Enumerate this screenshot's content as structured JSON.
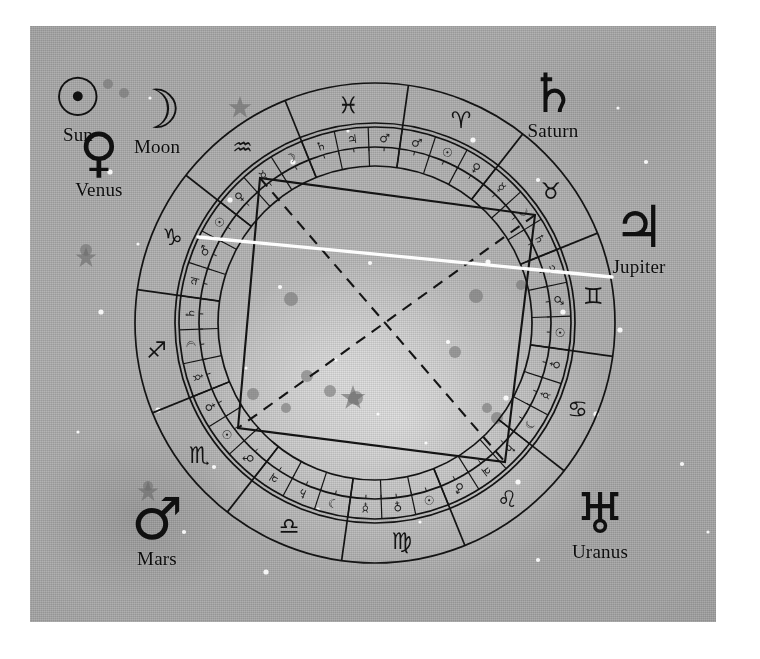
{
  "image": {
    "title": "Astrological natal chart wheel over a starfield photograph",
    "background_color": "#a9a9a9",
    "ink_color": "#141414",
    "highlight_line_color": "#ffffff",
    "plate": {
      "x": 30,
      "y": 26,
      "width": 686,
      "height": 596
    }
  },
  "planet_labels": [
    {
      "name": "Sun",
      "glyph": "☉",
      "icon": "sun-symbol",
      "x": 78,
      "y": 72,
      "glyph_size": 54,
      "label_x": 79,
      "label_y": 112
    },
    {
      "name": "Moon",
      "glyph": "☽",
      "icon": "moon-symbol",
      "x": 157,
      "y": 84,
      "glyph_size": 54,
      "label_x": 152,
      "label_y": 138
    },
    {
      "name": "Venus",
      "glyph": "♀",
      "icon": "venus-symbol",
      "x": 99,
      "y": 127,
      "glyph_size": 54,
      "label_x": 99,
      "label_y": 188
    },
    {
      "name": "Saturn",
      "glyph": "♄",
      "icon": "saturn-symbol",
      "x": 553,
      "y": 68,
      "glyph_size": 54,
      "label_x": 551,
      "label_y": 126
    },
    {
      "name": "Jupiter",
      "glyph": "♃",
      "icon": "jupiter-symbol",
      "x": 639,
      "y": 200,
      "glyph_size": 58,
      "label_x": 636,
      "label_y": 252
    },
    {
      "name": "Mars",
      "glyph": "♂",
      "icon": "mars-symbol",
      "x": 157,
      "y": 492,
      "glyph_size": 58,
      "label_x": 158,
      "label_y": 548
    },
    {
      "name": "Uranus",
      "glyph": "♅",
      "icon": "uranus-symbol",
      "x": 600,
      "y": 487,
      "glyph_size": 56,
      "label_x": 597,
      "label_y": 539
    }
  ],
  "wheel": {
    "center_x": 375,
    "center_y": 323,
    "radius_outer": 240,
    "radius_sign_band_inner": 200,
    "radius_decan_outer": 196,
    "radius_decan_mid": 176,
    "radius_decan_inner": 157,
    "rotation_deg": 8,
    "signs": [
      {
        "name": "Aries",
        "glyph": "♈",
        "index": 0
      },
      {
        "name": "Taurus",
        "glyph": "♉",
        "index": 1
      },
      {
        "name": "Gemini",
        "glyph": "♊",
        "index": 2
      },
      {
        "name": "Cancer",
        "glyph": "♋",
        "index": 3
      },
      {
        "name": "Leo",
        "glyph": "♌",
        "index": 4
      },
      {
        "name": "Virgo",
        "glyph": "♍",
        "index": 5
      },
      {
        "name": "Libra",
        "glyph": "♎",
        "index": 6
      },
      {
        "name": "Scorpio",
        "glyph": "♏",
        "index": 7
      },
      {
        "name": "Sagittarius",
        "glyph": "♐",
        "index": 8
      },
      {
        "name": "Capricorn",
        "glyph": "♑",
        "index": 9
      },
      {
        "name": "Aquarius",
        "glyph": "♒",
        "index": 10
      },
      {
        "name": "Pisces",
        "glyph": "♓",
        "index": 11
      }
    ],
    "decan_rulers": [
      "♂",
      "☉",
      "♀",
      "☿",
      "☽",
      "♄",
      "♃",
      "♂",
      "☉",
      "♀",
      "☿",
      "☽",
      "♄",
      "♃",
      "♂",
      "☉",
      "♀",
      "☿",
      "☽",
      "♄",
      "♃",
      "♂",
      "☉",
      "♀",
      "☿",
      "☽",
      "♄",
      "♃",
      "♂",
      "☉",
      "♀",
      "☿",
      "☽",
      "♄",
      "♃",
      "♂"
    ]
  },
  "aspect_figure": {
    "square_style": "solid",
    "diagonal_style": "dashed",
    "square_points": "260,178 535,215 505,462 238,428",
    "diagonal_1": "260,178 505,462",
    "diagonal_2": "535,215 238,428"
  },
  "highlight_line": {
    "from_x": 198,
    "from_y": 237,
    "to_x": 612,
    "to_y": 277
  },
  "stars_bright": [
    [
      83,
      300
    ],
    [
      120,
      232
    ],
    [
      212,
      188
    ],
    [
      275,
      150
    ],
    [
      330,
      119
    ],
    [
      455,
      128
    ],
    [
      520,
      168
    ],
    [
      602,
      318
    ],
    [
      578,
      402
    ],
    [
      500,
      470
    ],
    [
      402,
      510
    ],
    [
      300,
      497
    ],
    [
      196,
      455
    ],
    [
      140,
      398
    ],
    [
      262,
      275
    ],
    [
      318,
      348
    ],
    [
      360,
      402
    ],
    [
      430,
      330
    ],
    [
      470,
      250
    ],
    [
      545,
      300
    ],
    [
      228,
      356
    ],
    [
      352,
      251
    ],
    [
      408,
      431
    ],
    [
      488,
      386
    ],
    [
      166,
      520
    ],
    [
      628,
      150
    ],
    [
      92,
      160
    ],
    [
      664,
      452
    ],
    [
      248,
      560
    ],
    [
      520,
      548
    ],
    [
      600,
      96
    ],
    [
      700,
      260
    ],
    [
      60,
      420
    ],
    [
      690,
      520
    ],
    [
      132,
      86
    ]
  ],
  "stars_dark": [
    [
      291,
      299
    ],
    [
      307,
      376
    ],
    [
      330,
      391
    ],
    [
      286,
      408
    ],
    [
      253,
      394
    ],
    [
      356,
      398
    ],
    [
      487,
      408
    ],
    [
      497,
      418
    ],
    [
      476,
      296
    ],
    [
      521,
      285
    ],
    [
      455,
      352
    ],
    [
      108,
      84
    ],
    [
      124,
      93
    ],
    [
      86,
      250
    ],
    [
      148,
      486
    ],
    [
      353,
      399
    ]
  ],
  "star_bursts": [
    [
      240,
      108,
      12
    ],
    [
      86,
      258,
      11
    ],
    [
      148,
      492,
      11
    ],
    [
      353,
      398,
      13
    ]
  ]
}
